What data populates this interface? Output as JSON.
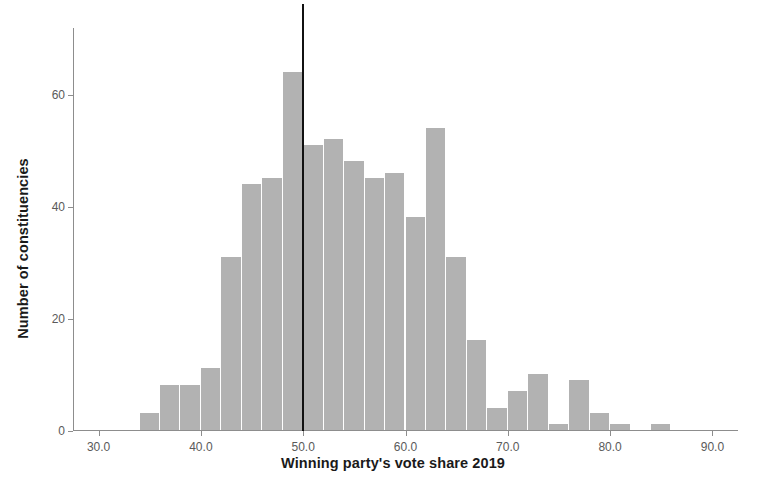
{
  "chart_data": {
    "type": "bar",
    "title": "",
    "subtitle": "",
    "xlabel": "Winning party's vote share 2019",
    "ylabel": "Number of constituencies",
    "xlim": [
      27.5,
      92.5
    ],
    "ylim": [
      0,
      72
    ],
    "xticks": [
      "30.0",
      "40.0",
      "50.0",
      "60.0",
      "70.0",
      "80.0",
      "90.0"
    ],
    "xtick_values": [
      30,
      40,
      50,
      60,
      70,
      80,
      90
    ],
    "yticks": [
      "0",
      "20",
      "40",
      "60"
    ],
    "ytick_values": [
      0,
      20,
      40,
      60
    ],
    "grid": false,
    "legend": null,
    "bin_width": 2,
    "bar_color": "#b2b2b2",
    "axis_color": "#8d8d8d",
    "categories": [
      34,
      36,
      38,
      40,
      42,
      44,
      46,
      48,
      50,
      52,
      54,
      56,
      58,
      60,
      62,
      64,
      66,
      68,
      70,
      72,
      74,
      76,
      78,
      80,
      82,
      84,
      86
    ],
    "values": [
      3,
      8,
      8,
      11,
      31,
      44,
      45,
      64,
      51,
      52,
      48,
      45,
      46,
      38,
      54,
      31,
      16,
      4,
      7,
      10,
      1,
      9,
      3,
      1,
      0,
      1,
      0
    ],
    "bars": [
      {
        "bin_start": 34,
        "bin_end": 36,
        "value": 3
      },
      {
        "bin_start": 36,
        "bin_end": 38,
        "value": 8
      },
      {
        "bin_start": 38,
        "bin_end": 40,
        "value": 8
      },
      {
        "bin_start": 40,
        "bin_end": 42,
        "value": 11
      },
      {
        "bin_start": 42,
        "bin_end": 44,
        "value": 31
      },
      {
        "bin_start": 44,
        "bin_end": 46,
        "value": 44
      },
      {
        "bin_start": 46,
        "bin_end": 48,
        "value": 45
      },
      {
        "bin_start": 48,
        "bin_end": 50,
        "value": 64
      },
      {
        "bin_start": 50,
        "bin_end": 52,
        "value": 51
      },
      {
        "bin_start": 52,
        "bin_end": 54,
        "value": 52
      },
      {
        "bin_start": 54,
        "bin_end": 56,
        "value": 48
      },
      {
        "bin_start": 56,
        "bin_end": 58,
        "value": 45
      },
      {
        "bin_start": 58,
        "bin_end": 60,
        "value": 46
      },
      {
        "bin_start": 60,
        "bin_end": 62,
        "value": 38
      },
      {
        "bin_start": 62,
        "bin_end": 64,
        "value": 54
      },
      {
        "bin_start": 64,
        "bin_end": 66,
        "value": 31
      },
      {
        "bin_start": 66,
        "bin_end": 68,
        "value": 16
      },
      {
        "bin_start": 68,
        "bin_end": 70,
        "value": 4
      },
      {
        "bin_start": 70,
        "bin_end": 72,
        "value": 7
      },
      {
        "bin_start": 72,
        "bin_end": 74,
        "value": 10
      },
      {
        "bin_start": 74,
        "bin_end": 76,
        "value": 1
      },
      {
        "bin_start": 76,
        "bin_end": 78,
        "value": 9
      },
      {
        "bin_start": 78,
        "bin_end": 80,
        "value": 3
      },
      {
        "bin_start": 80,
        "bin_end": 82,
        "value": 1
      },
      {
        "bin_start": 82,
        "bin_end": 84,
        "value": 0
      },
      {
        "bin_start": 84,
        "bin_end": 86,
        "value": 1
      }
    ],
    "annotations": [
      {
        "type": "vline",
        "name": "fifty-percent-reference-line",
        "x": 50,
        "color": "#111111"
      }
    ]
  }
}
